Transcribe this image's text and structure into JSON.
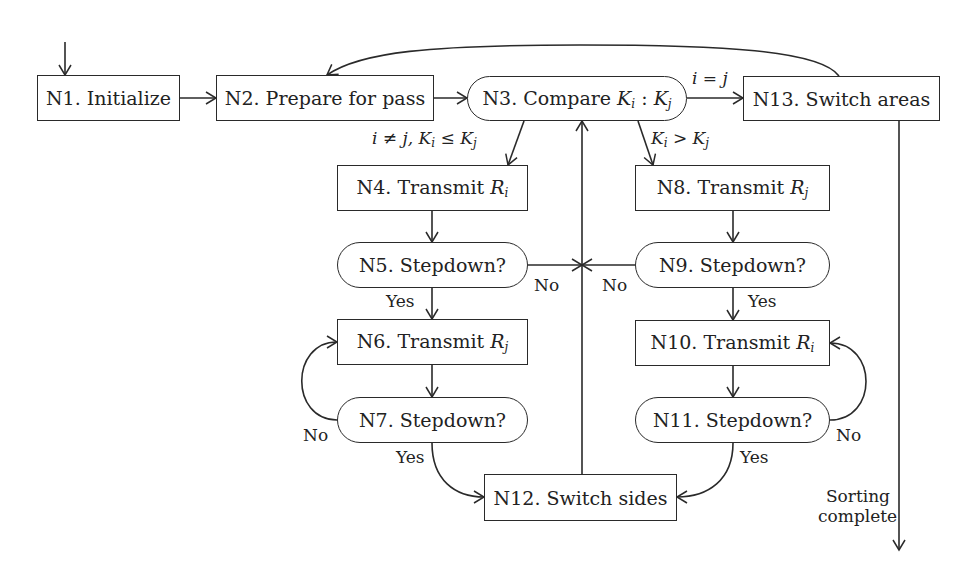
{
  "diagram": {
    "nodes": {
      "n1": {
        "label": "N1. Initialize"
      },
      "n2": {
        "label": "N2. Prepare for pass"
      },
      "n3": {
        "label_prefix": "N3. Compare ",
        "k": "K",
        "sub_i": "i",
        "sep": " : ",
        "sub_j": "j"
      },
      "n4": {
        "label_prefix": "N4. Transmit ",
        "r": "R",
        "sub": "i"
      },
      "n5": {
        "label": "N5. Stepdown?"
      },
      "n6": {
        "label_prefix": "N6. Transmit ",
        "r": "R",
        "sub": "j"
      },
      "n7": {
        "label": "N7. Stepdown?"
      },
      "n8": {
        "label_prefix": "N8. Transmit ",
        "r": "R",
        "sub": "j"
      },
      "n9": {
        "label": "N9. Stepdown?"
      },
      "n10": {
        "label_prefix": "N10. Transmit ",
        "r": "R",
        "sub": "i"
      },
      "n11": {
        "label": "N11. Stepdown?"
      },
      "n12": {
        "label": "N12. Switch sides"
      },
      "n13": {
        "label": "N13. Switch areas"
      }
    },
    "edge_labels": {
      "i_eq_j": "i = j",
      "le_cond_a": "i ≠ j, ",
      "le_k": "K",
      "le_i": "i",
      "le_op": " ≤ ",
      "le_j": "j",
      "gt_k": "K",
      "gt_i": "i",
      "gt_op": " > ",
      "gt_j": "j",
      "n5_no": "No",
      "n9_no": "No",
      "n5_yes": "Yes",
      "n9_yes": "Yes",
      "n7_no": "No",
      "n11_no": "No",
      "n7_yes": "Yes",
      "n11_yes": "Yes",
      "sorting_line1": "Sorting",
      "sorting_line2": "complete"
    }
  }
}
